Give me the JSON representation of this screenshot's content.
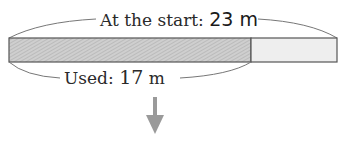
{
  "diagram": {
    "total_label_prefix": "At the start: ",
    "total_value": "23",
    "total_unit": " m",
    "used_label_prefix": "Used: ",
    "used_value": "17",
    "used_unit": " m",
    "colors": {
      "used_fill": "#c8c8c8",
      "remaining_fill": "#eeeeee",
      "outline": "#555555",
      "arrow": "#9a9a9a",
      "brace": "#777777"
    },
    "bar": {
      "total": 23,
      "used": 17
    }
  }
}
